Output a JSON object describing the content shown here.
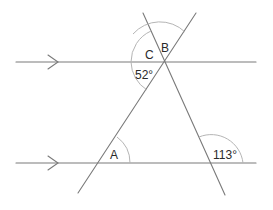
{
  "diagram": {
    "type": "parallel-lines-transversals",
    "labels": {
      "angle_a": "A",
      "angle_b": "B",
      "angle_c": "C",
      "angle_52": "52°",
      "angle_113": "113°"
    },
    "colors": {
      "line": "#7a7a7a",
      "arc": "#b5b5b5",
      "text": "#2a2a2a"
    }
  }
}
